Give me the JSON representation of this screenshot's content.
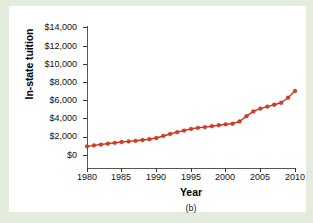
{
  "figure": {
    "caption": "(b)",
    "background_color": "#e3ecdd",
    "panel_color": "#ffffff"
  },
  "chart_data": {
    "type": "line",
    "title": "",
    "subtitle": "",
    "xlabel": "Year",
    "ylabel": "In-state tuition",
    "series_color": "#cc3322",
    "marker_color": "#e03c20",
    "marker": "circle",
    "grid": false,
    "legend": false,
    "xlim": [
      1980,
      2010
    ],
    "ylim": [
      0,
      14000
    ],
    "xticks": [
      1980,
      1985,
      1990,
      1995,
      2000,
      2005,
      2010
    ],
    "xtick_labels": [
      "1980",
      "1985",
      "1990",
      "1995",
      "2000",
      "2005",
      "2010"
    ],
    "yticks": [
      0,
      2000,
      4000,
      6000,
      8000,
      10000,
      12000,
      14000
    ],
    "ytick_labels": [
      "$0",
      "$2,000",
      "$4,000",
      "$6,000",
      "$8,000",
      "$10,000",
      "$12,000",
      "$14,000"
    ],
    "x": [
      1980,
      1981,
      1982,
      1983,
      1984,
      1985,
      1986,
      1987,
      1988,
      1989,
      1990,
      1991,
      1992,
      1993,
      1994,
      1995,
      1996,
      1997,
      1998,
      1999,
      2000,
      2001,
      2002,
      2003,
      2004,
      2005,
      2006,
      2007,
      2008,
      2009,
      2010
    ],
    "values": [
      2150,
      2250,
      2330,
      2420,
      2500,
      2580,
      2640,
      2700,
      2780,
      2860,
      2980,
      3180,
      3380,
      3560,
      3720,
      3880,
      3990,
      4060,
      4150,
      4250,
      4340,
      4400,
      4620,
      5150,
      5620,
      5900,
      6100,
      6280,
      6480,
      6980,
      7650
    ]
  }
}
